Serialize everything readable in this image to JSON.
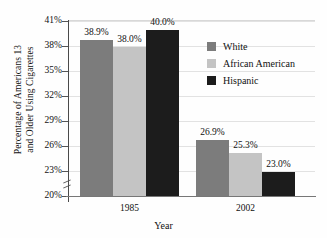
{
  "chart_data": {
    "type": "bar",
    "title": "",
    "xlabel": "Year",
    "ylabel": "Percentage of Americans 13\nand Older Using Cigarettes",
    "categories": [
      "1985",
      "2002"
    ],
    "series": [
      {
        "name": "White",
        "color": "#7c7c7c",
        "values": [
          38.9,
          26.9
        ],
        "labels": [
          "38.9%",
          "25.3%"
        ]
      },
      {
        "name": "African American",
        "color": "#c4c4c4",
        "values": [
          38.0,
          25.3
        ],
        "labels": [
          "38.0%",
          "25.3%"
        ]
      },
      {
        "name": "Hispanic",
        "color": "#1c1c1c",
        "values": [
          40.0,
          23.0
        ],
        "labels": [
          "40.0%",
          "23.0%"
        ]
      }
    ],
    "ylim": [
      20,
      41
    ],
    "y_axis_broken": true,
    "ytick_labels": [
      "20%",
      "23%",
      "26%",
      "29%",
      "32%",
      "35%",
      "38%",
      "41%"
    ],
    "ytick_values": [
      20,
      23,
      26,
      29,
      32,
      35,
      38,
      41
    ],
    "grid": true,
    "legend_position": "upper-right",
    "bars": [
      {
        "group": "1985",
        "series": "White",
        "value": 38.9,
        "label": "38.9%"
      },
      {
        "group": "1985",
        "series": "African American",
        "value": 38.0,
        "label": "38.0%"
      },
      {
        "group": "1985",
        "series": "Hispanic",
        "value": 40.0,
        "label": "40.0%"
      },
      {
        "group": "2002",
        "series": "White",
        "value": 26.9,
        "label": "26.9%"
      },
      {
        "group": "2002",
        "series": "African American",
        "value": 25.3,
        "label": "25.3%"
      },
      {
        "group": "2002",
        "series": "Hispanic",
        "value": 23.0,
        "label": "23.0%"
      }
    ]
  },
  "legend": {
    "items": [
      {
        "label": "White",
        "color": "#7c7c7c"
      },
      {
        "label": "African American",
        "color": "#c4c4c4"
      },
      {
        "label": "Hispanic",
        "color": "#1c1c1c"
      }
    ]
  },
  "axes": {
    "y_title": "Percentage of Americans 13\nand Older Using Cigarettes",
    "x_title": "Year"
  }
}
